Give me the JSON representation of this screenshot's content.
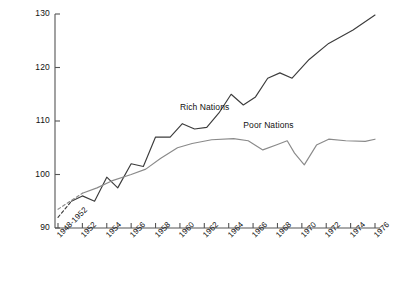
{
  "chart_data": {
    "type": "line",
    "title": "",
    "subtitle": "",
    "xlabel": "",
    "ylabel": "",
    "ylim": [
      90,
      130
    ],
    "xlim_index": [
      0,
      13
    ],
    "grid": false,
    "legend_position": "inline-annotations",
    "ytick_labels": [
      "90",
      "100",
      "110",
      "120",
      "130"
    ],
    "ytick_values": [
      90,
      100,
      110,
      120,
      130
    ],
    "categories": [
      "1948-1952",
      "1952",
      "1954",
      "1956",
      "1958",
      "1960",
      "1962",
      "1964",
      "1966",
      "1968",
      "1970",
      "1972",
      "1974",
      "1976"
    ],
    "x_values": [
      1950,
      1952,
      1954,
      1956,
      1958,
      1960,
      1962,
      1964,
      1966,
      1968,
      1970,
      1972,
      1974,
      1976
    ],
    "series": [
      {
        "name": "Rich Nations",
        "color": "#3c3c3c",
        "label_anchor_index": 5,
        "values": [
          92.0,
          96.0,
          95.0,
          99.5,
          102.0,
          101.5,
          107.0,
          107.5,
          111.5,
          109.0,
          115.0,
          119.5,
          124.0,
          129.5
        ],
        "dashed_lead_in": true,
        "vertices": [
          {
            "x_index": 0.0,
            "y": 92.0
          },
          {
            "x_index": 0.55,
            "y": 95.0
          },
          {
            "x_index": 1.0,
            "y": 96.0
          },
          {
            "x_index": 1.5,
            "y": 95.0
          },
          {
            "x_index": 2.0,
            "y": 99.5
          },
          {
            "x_index": 2.45,
            "y": 97.5
          },
          {
            "x_index": 3.0,
            "y": 102.0
          },
          {
            "x_index": 3.5,
            "y": 101.5
          },
          {
            "x_index": 4.0,
            "y": 107.0
          },
          {
            "x_index": 4.6,
            "y": 107.0
          },
          {
            "x_index": 5.1,
            "y": 109.5
          },
          {
            "x_index": 5.6,
            "y": 108.5
          },
          {
            "x_index": 6.1,
            "y": 108.8
          },
          {
            "x_index": 6.6,
            "y": 111.5
          },
          {
            "x_index": 7.1,
            "y": 115.0
          },
          {
            "x_index": 7.6,
            "y": 113.0
          },
          {
            "x_index": 8.1,
            "y": 114.5
          },
          {
            "x_index": 8.6,
            "y": 118.0
          },
          {
            "x_index": 9.1,
            "y": 119.0
          },
          {
            "x_index": 9.6,
            "y": 118.0
          },
          {
            "x_index": 10.3,
            "y": 121.5
          },
          {
            "x_index": 11.1,
            "y": 124.5
          },
          {
            "x_index": 12.1,
            "y": 127.0
          },
          {
            "x_index": 13.0,
            "y": 129.8
          }
        ]
      },
      {
        "name": "Poor Nations",
        "color": "#8a8a8a",
        "label_anchor_index": 7,
        "values": [
          93.5,
          96.5,
          98.0,
          100.0,
          102.0,
          105.0,
          106.5,
          106.8,
          104.8,
          106.2,
          101.8,
          106.5,
          107.0,
          106.5
        ],
        "dashed_lead_in": true,
        "vertices": [
          {
            "x_index": 0.0,
            "y": 93.5
          },
          {
            "x_index": 1.0,
            "y": 96.5
          },
          {
            "x_index": 1.6,
            "y": 97.5
          },
          {
            "x_index": 2.2,
            "y": 98.8
          },
          {
            "x_index": 3.0,
            "y": 100.0
          },
          {
            "x_index": 3.6,
            "y": 101.0
          },
          {
            "x_index": 4.2,
            "y": 103.0
          },
          {
            "x_index": 4.9,
            "y": 105.0
          },
          {
            "x_index": 5.5,
            "y": 105.8
          },
          {
            "x_index": 6.3,
            "y": 106.5
          },
          {
            "x_index": 7.2,
            "y": 106.7
          },
          {
            "x_index": 7.8,
            "y": 106.3
          },
          {
            "x_index": 8.4,
            "y": 104.6
          },
          {
            "x_index": 9.0,
            "y": 105.6
          },
          {
            "x_index": 9.4,
            "y": 106.3
          },
          {
            "x_index": 9.7,
            "y": 104.0
          },
          {
            "x_index": 10.1,
            "y": 101.8
          },
          {
            "x_index": 10.6,
            "y": 105.5
          },
          {
            "x_index": 11.1,
            "y": 106.6
          },
          {
            "x_index": 11.8,
            "y": 106.3
          },
          {
            "x_index": 12.6,
            "y": 106.2
          },
          {
            "x_index": 13.0,
            "y": 106.6
          }
        ]
      }
    ],
    "annotations": [
      {
        "text": "Rich Nations",
        "x_index": 5.0,
        "y": 112.5
      },
      {
        "text": "Poor Nations",
        "x_index": 7.6,
        "y": 109.0
      }
    ]
  },
  "axes": {
    "y_axis_name": "value-axis",
    "x_axis_name": "year-axis"
  }
}
